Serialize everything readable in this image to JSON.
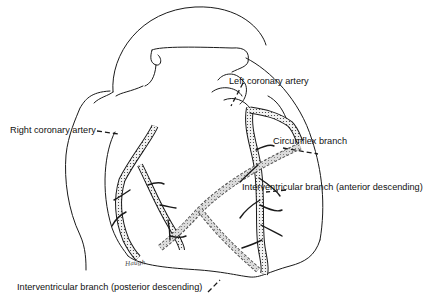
{
  "figure": {
    "labels": {
      "left_coronary_artery": "Left coronary artery",
      "right_coronary_artery": "Right coronary artery",
      "circumflex_branch": "Circumflex branch",
      "anterior_descending": "Interventricular branch (anterior descending)",
      "posterior_descending": "Interventricular branch (posterior descending)"
    },
    "signature": "Haugh"
  },
  "colors": {
    "line": "#1a1a1a",
    "background": "#ffffff",
    "vessel_fill": "#e6e6e6"
  }
}
